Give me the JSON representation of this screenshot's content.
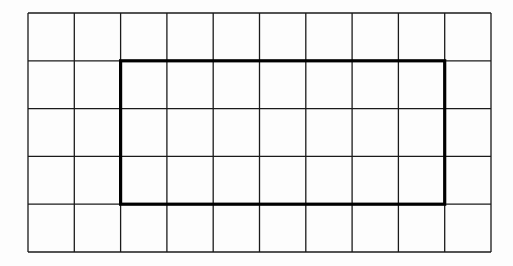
{
  "diagram": {
    "type": "grid-with-rectangle",
    "grid": {
      "columns": 10,
      "rows": 5,
      "left": 28,
      "top": 13,
      "right": 491,
      "bottom": 252,
      "line_color": "#1a1a1a",
      "line_width": 1.3
    },
    "rectangle": {
      "col_start": 2,
      "col_end": 9,
      "row_start": 1,
      "row_end": 4,
      "width_units": 7,
      "height_units": 3,
      "line_color": "#000000",
      "line_width": 3.2
    },
    "background": "#fdfdfd"
  }
}
